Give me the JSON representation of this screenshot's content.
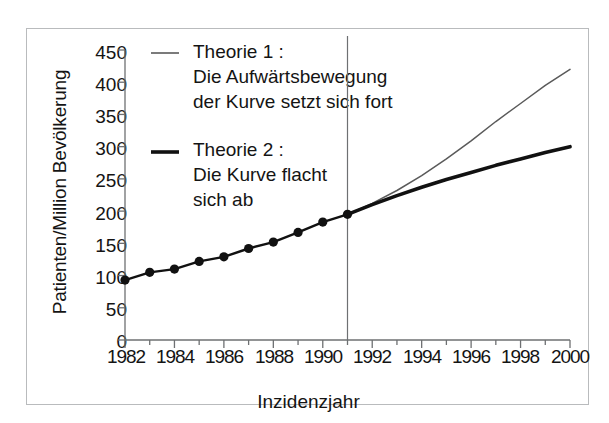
{
  "chart_data": {
    "type": "line",
    "title": "",
    "xlabel": "Inzidenzjahr",
    "ylabel": "Patienten/Million Bevölkerung",
    "xlim": [
      1982,
      2000
    ],
    "ylim": [
      0,
      450
    ],
    "xticks": [
      "1982",
      "1984",
      "1986",
      "1988",
      "1990",
      "1992",
      "1994",
      "1996",
      "1998",
      "2000"
    ],
    "xtick_values": [
      1982,
      1984,
      1986,
      1988,
      1990,
      1992,
      1994,
      1996,
      1998,
      2000
    ],
    "yticks": [
      "0",
      "50",
      "100",
      "150",
      "200",
      "250",
      "300",
      "350",
      "400",
      "450"
    ],
    "ytick_values": [
      0,
      50,
      100,
      150,
      200,
      250,
      300,
      350,
      400,
      450
    ],
    "grid": false,
    "minor_xticks_every": 1,
    "minor_yticks_every": 50,
    "legend_position": "upper-left-inside",
    "annotations": [
      {
        "name": "projection-divider",
        "type": "vline",
        "x": 1991
      }
    ],
    "series": [
      {
        "name": "Beobachtete Daten",
        "style": "line-with-markers",
        "marker": "filled-circle",
        "x": [
          1982,
          1983,
          1984,
          1985,
          1986,
          1987,
          1988,
          1989,
          1990,
          1991
        ],
        "values": [
          93,
          105,
          110,
          122,
          129,
          142,
          152,
          167,
          183,
          195
        ]
      },
      {
        "name": "Theorie 1",
        "style": "thin-line",
        "legend_label": "Theorie 1 :",
        "legend_desc_line1": "Die Aufwärtsbewegung",
        "legend_desc_line2": "der Kurve setzt sich fort",
        "x": [
          1991,
          1992,
          1993,
          1994,
          1995,
          1996,
          1997,
          1998,
          1999,
          2000
        ],
        "values": [
          195,
          212,
          232,
          255,
          281,
          309,
          339,
          367,
          395,
          420
        ]
      },
      {
        "name": "Theorie 2",
        "style": "thick-line",
        "legend_label": "Theorie 2 :",
        "legend_desc_line1": "Die Kurve flacht",
        "legend_desc_line2": "sich ab",
        "x": [
          1991,
          1992,
          1993,
          1994,
          1995,
          1996,
          1997,
          1998,
          1999,
          2000
        ],
        "values": [
          195,
          210,
          224,
          237,
          249,
          260,
          271,
          281,
          291,
          300
        ]
      }
    ],
    "colors": {
      "theorie1_line": "#5a5a5a",
      "theorie2_line": "#111111",
      "data_line": "#111111",
      "marker": "#111111",
      "axis": "#6e7072",
      "frame": "#b9bbbd",
      "text": "#141414",
      "background": "#ffffff"
    }
  },
  "legend": {
    "entries": [
      {
        "label": "Theorie 1 :",
        "desc1": "Die Aufwärtsbewegung",
        "desc2": "der Kurve setzt sich fort"
      },
      {
        "label": "Theorie 2 :",
        "desc1": "Die Kurve flacht",
        "desc2": "sich ab"
      }
    ]
  }
}
